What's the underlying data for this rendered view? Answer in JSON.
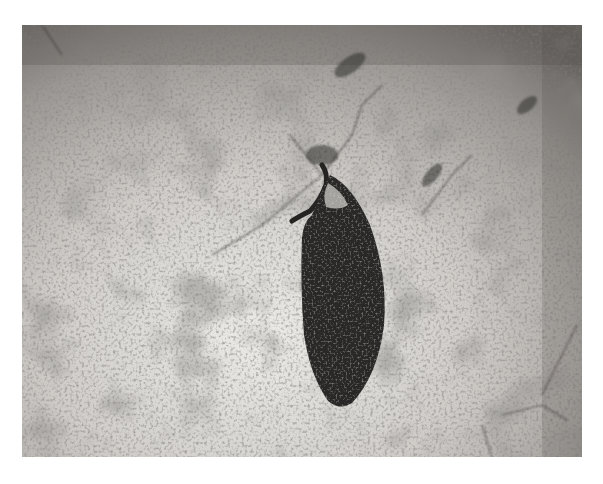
{
  "image": {
    "description": "Grayscale photograph of a dark elongated leaf-shaped specimen with a short stalk lying on a speckled light-gray surface",
    "subject": "leaf-shaped specimen",
    "background": "speckled gray stone surface",
    "colors": {
      "page": "#ffffff",
      "surface_light": "#d9d6d2",
      "surface_mid": "#a9a6a2",
      "surface_dark": "#6e6b68",
      "specimen": "#2a2827"
    }
  }
}
